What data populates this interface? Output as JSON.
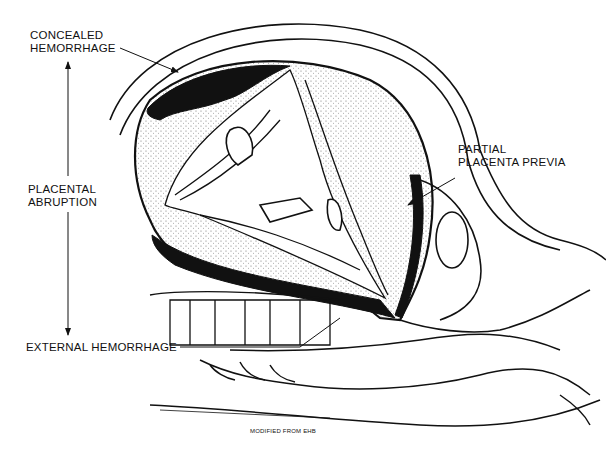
{
  "figure": {
    "colors": {
      "ink": "#111111",
      "background": "#ffffff",
      "stipple": "#e8e8e8"
    }
  },
  "labels": {
    "concealed_hemorrhage": [
      "CONCEALED",
      "HEMORRHAGE"
    ],
    "placental_abruption": [
      "PLACENTAL",
      "ABRUPTION"
    ],
    "partial_placenta_previa": [
      "PARTIAL",
      "PLACENTA PREVIA"
    ],
    "external_hemorrhage": "EXTERNAL HEMORRHAGE",
    "credit": "MODIFIED FROM EHB"
  }
}
